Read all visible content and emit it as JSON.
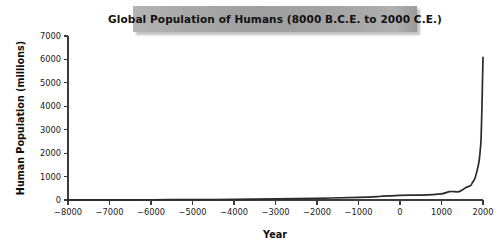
{
  "title": {
    "text": "Global Population of Humans (8000 B.C.E. to 2000 C.E.)"
  },
  "axes": {
    "x_label": "Year",
    "y_label": "Human Population (millions)"
  },
  "colors": {
    "banner_left": "#b4b4b4",
    "banner_right": "#9a9a9a",
    "axis": "#3c3c3c",
    "curve": "#2b2b2b",
    "background": "#ffffff"
  },
  "chart_data": {
    "type": "line",
    "title": "Global Population of Humans (8000 B.C.E. to 2000 C.E.)",
    "xlabel": "Year",
    "ylabel": "Human Population (millions)",
    "xlim": [
      -8000,
      2000
    ],
    "ylim": [
      0,
      7000
    ],
    "grid": false,
    "legend": null,
    "x_ticks": [
      -8000,
      -7000,
      -6000,
      -5000,
      -4000,
      -3000,
      -2000,
      -1000,
      0,
      1000,
      2000
    ],
    "x_tick_labels": [
      "−8000",
      "−7000",
      "−6000",
      "−5000",
      "−4000",
      "−3000",
      "−2000",
      "−1000",
      "0",
      "1000",
      "2000"
    ],
    "y_ticks": [
      0,
      1000,
      2000,
      3000,
      4000,
      5000,
      6000,
      7000
    ],
    "y_tick_labels": [
      "0",
      "1000",
      "2000",
      "3000",
      "4000",
      "5000",
      "6000",
      "7000"
    ],
    "series": [
      {
        "name": "Human Population",
        "x": [
          -8000,
          -7000,
          -6000,
          -5000,
          -4000,
          -3000,
          -2000,
          -1000,
          -500,
          0,
          500,
          1000,
          1200,
          1400,
          1500,
          1600,
          1700,
          1750,
          1800,
          1850,
          1900,
          1927,
          1950,
          1960,
          1975,
          1987,
          1999,
          2000
        ],
        "values": [
          5,
          7,
          10,
          15,
          25,
          45,
          72,
          115,
          150,
          200,
          210,
          265,
          360,
          350,
          425,
          545,
          610,
          760,
          900,
          1200,
          1600,
          2000,
          2500,
          3000,
          4000,
          5000,
          6000,
          6050
        ]
      }
    ]
  }
}
